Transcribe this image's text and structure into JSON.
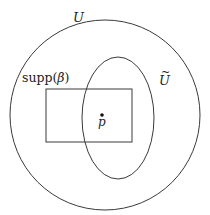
{
  "diagram": {
    "stroke_color": "#3a3a3a",
    "shapes": {
      "outer_circle": {
        "label": "U",
        "cx": 105,
        "cy": 115,
        "r": 95
      },
      "ellipse": {
        "label": "Ũ",
        "cx": 118,
        "cy": 118,
        "rx": 36,
        "ry": 61
      },
      "rectangle": {
        "label": "supp(β)",
        "x": 46,
        "y": 89,
        "width": 86,
        "height": 53
      },
      "point": {
        "label": "p",
        "cx": 102,
        "cy": 115
      }
    },
    "labels": {
      "U": "U",
      "U_tilde_base": "U",
      "U_tilde_accent": "~",
      "supp_name": "supp",
      "supp_open": "(",
      "supp_beta": "β",
      "supp_close": ")",
      "p": "p"
    }
  }
}
